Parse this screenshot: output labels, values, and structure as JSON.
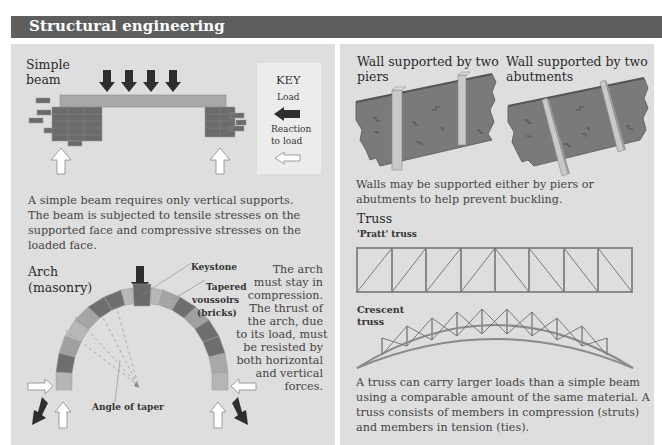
{
  "header": {
    "title": "Structural engineering",
    "bar_color": "#5e5e5e"
  },
  "simple_beam": {
    "title_line1": "Simple",
    "title_line2": "beam",
    "description": [
      "A simple beam requires only vertical supports.",
      "The beam is subjected to tensile stresses on the",
      "supported face and compressive stresses on the",
      "loaded face."
    ]
  },
  "key": {
    "title": "KEY",
    "load_label": "Load",
    "reaction_line1": "Reaction",
    "reaction_line2": "to load",
    "load_icon": "dark-arrow-icon",
    "reaction_icon": "hollow-arrow-icon"
  },
  "arch": {
    "title_line1": "Arch",
    "title_line2": "(masonry)",
    "labels": {
      "keystone": "Keystone",
      "voussoirs_line1": "Tapered",
      "voussoirs_line2": "voussoirs",
      "voussoirs_line3": "(bricks)",
      "angle_of_taper": "Angle of taper"
    },
    "description": [
      "The arch",
      "must stay in",
      "compression.",
      "The thrust of",
      "the arch, due",
      "to its load, must",
      "be resisted by",
      "both horizontal",
      "and vertical",
      "forces."
    ]
  },
  "walls": {
    "piers_title_line1": "Wall supported by two",
    "piers_title_line2": "piers",
    "abutments_title_line1": "Wall supported by two",
    "abutments_title_line2": "abutments",
    "description": [
      "Walls may be supported either by piers or",
      "abutments to help prevent buckling."
    ]
  },
  "truss": {
    "title": "Truss",
    "pratt_label": "'Pratt' truss",
    "crescent_line1": "Crescent",
    "crescent_line2": "truss",
    "description": [
      "A truss can carry larger loads than a simple beam",
      "using a comparable amount of the same material. A",
      "truss consists of members in compression (struts)",
      "and members in tension (ties)."
    ]
  },
  "colors": {
    "panel_bg": "#dedede",
    "brick": "#6e6e6e",
    "beam": "#a8a8a8",
    "arrow_dark": "#2e2e2e",
    "wall": "#7a7a7a"
  }
}
